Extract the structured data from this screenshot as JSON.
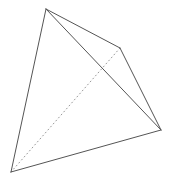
{
  "figure": {
    "background_color": "#ffffff",
    "canvas": {
      "width": 172,
      "height": 182
    },
    "solid_edge_color": "#555555",
    "hidden_edge_color": "#999999",
    "solid_edge_width": 1,
    "hidden_edge_width": 1,
    "hidden_edge_dash": "1 3"
  },
  "chart_data": {
    "type": "diagram",
    "vertices": [
      {
        "id": "A",
        "role": "apex-top",
        "x": 46,
        "y": 9
      },
      {
        "id": "B",
        "role": "bottom-left",
        "x": 11,
        "y": 172
      },
      {
        "id": "C",
        "role": "right",
        "x": 161,
        "y": 130
      },
      {
        "id": "D",
        "role": "back-hidden-upper",
        "x": 120,
        "y": 48
      }
    ],
    "edges": [
      {
        "from": "A",
        "to": "B",
        "style": "solid",
        "path": "M46,9 L11,172"
      },
      {
        "from": "A",
        "to": "D",
        "style": "solid",
        "path": "M46,9 L120,48"
      },
      {
        "from": "A",
        "to": "C",
        "style": "solid",
        "path": "M46,9 L161,130"
      },
      {
        "from": "D",
        "to": "C",
        "style": "solid",
        "path": "M120,48 L161,130"
      },
      {
        "from": "B",
        "to": "C",
        "style": "solid",
        "path": "M11,172 L161,130"
      },
      {
        "from": "B",
        "to": "D",
        "style": "hidden",
        "path": "M11,172 L120,48"
      }
    ],
    "edge_count": 6,
    "vertex_count": 4,
    "face_count": 4,
    "hidden_edge_ids": [
      "B-D"
    ],
    "xlabel": "",
    "ylabel": "",
    "grid": false,
    "legend": false,
    "annotations": []
  }
}
